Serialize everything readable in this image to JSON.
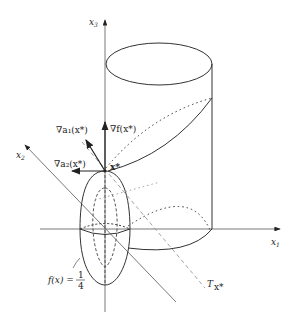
{
  "axes": {
    "x1": {
      "label": "x",
      "sub": "1"
    },
    "x2": {
      "label": "x",
      "sub": "2"
    },
    "x3": {
      "label": "x",
      "sub": "3"
    }
  },
  "labels": {
    "grad_f": "∇f(x*)",
    "grad_a1": "∇a₁(x*)",
    "grad_a2": "∇a₂(x*)",
    "point": "x*",
    "level_set_lhs": "f(x) =",
    "level_set_num": "1",
    "level_set_den": "4",
    "tangent_plane": "T",
    "tangent_sub": "x*"
  },
  "colors": {
    "stroke": "#333333",
    "axis": "#555555",
    "dashed": "#888888"
  }
}
